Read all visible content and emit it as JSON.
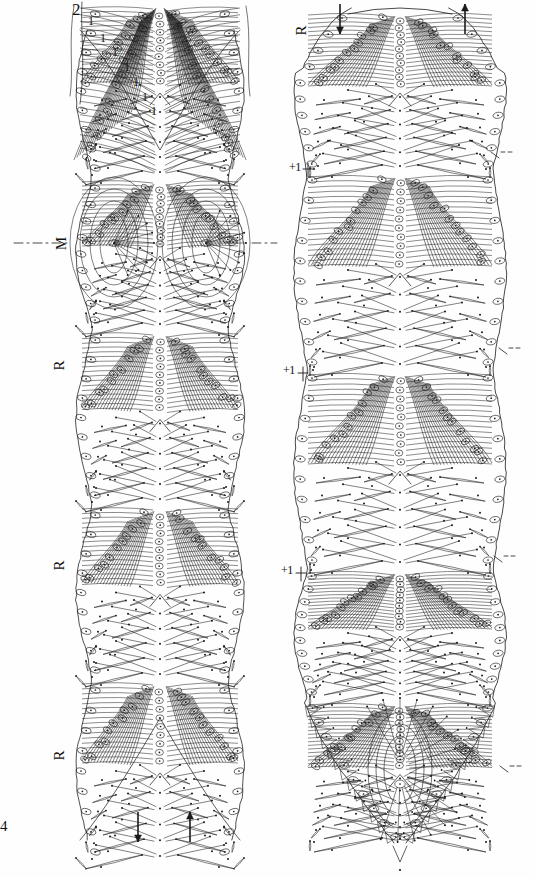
{
  "figure": {
    "type": "scientific-line-drawing",
    "background_color": "#ffffff",
    "ink_color": "#1a1a1a",
    "plate_number": "4",
    "panels": [
      {
        "id": "left-panel",
        "name": "left-specimen-map",
        "outline": "elongate, bilaterally symmetrical, deeply notched anterior (V-shaped cleft) and deeply notched posterior (inverted V cleft)",
        "segments": 5,
        "axis_line": {
          "style": "dash-dot",
          "label": "M",
          "y": 243
        }
      },
      {
        "id": "right-panel",
        "name": "right-specimen-map",
        "outline": "elongate oval, rounded anterior, tapering to an acute posterior point with a terminal ovate organ",
        "segments": 5,
        "terminal_organ": "concentric ovate structure with two setal pores"
      }
    ],
    "labels": {
      "top_number": "2",
      "series_number": "1",
      "series_count": 7,
      "midline_label": "M",
      "region_label": "R",
      "increment_label": "+1",
      "plate_label": "4"
    },
    "label_items": {
      "left_top_2": "2",
      "left_series_1": [
        "1",
        "1",
        "1",
        "1",
        "1",
        "1",
        "1"
      ],
      "left_midline_M": "M",
      "left_region_R": [
        "R",
        "R",
        "R"
      ],
      "right_region_R": "R",
      "right_increments": [
        "+1",
        "+1",
        "+1"
      ],
      "plate_number": "4"
    },
    "arrows": {
      "left_bottom": [
        "down",
        "up"
      ],
      "right_top": [
        "down",
        "up"
      ],
      "description": "paired directional arrows marking the orientation of the setal rows"
    },
    "legend_note": ""
  },
  "chart_data": {
    "type": "scatter",
    "title": "",
    "xlabel": "",
    "ylabel": "",
    "series": [
      {
        "name": "setal-sockets-left",
        "count": 168,
        "marker": "ringed-oval-with-central-dot"
      },
      {
        "name": "setae-lines-left",
        "count": 240,
        "marker": "line-with-terminal-dot"
      },
      {
        "name": "setal-sockets-right",
        "count": 182,
        "marker": "ringed-oval-with-central-dot"
      },
      {
        "name": "setae-lines-right",
        "count": 260,
        "marker": "line-with-terminal-dot"
      }
    ]
  },
  "watermark": {
    "text": ""
  }
}
